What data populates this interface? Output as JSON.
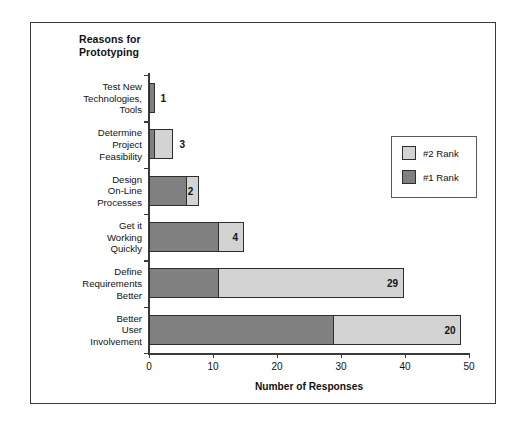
{
  "chart_data": {
    "type": "bar",
    "orientation": "horizontal",
    "stacked": true,
    "title": "Reasons for\nPrototyping",
    "xlabel": "Number of Responses",
    "ylabel": "",
    "xlim": [
      0,
      50
    ],
    "xticks": [
      0,
      10,
      20,
      30,
      40,
      50
    ],
    "xtick_labels": [
      "0",
      "10",
      "20",
      "30",
      "40",
      "50"
    ],
    "grid": false,
    "legend_position": "upper right",
    "categories": [
      "Test New\nTechnologies,\nTools",
      "Determine\nProject\nFeasibility",
      "Design\nOn-Line\nProcesses",
      "Get it\nWorking\nQuickly",
      "Define\nRequirements\nBetter",
      "Better\nUser\nInvolvement"
    ],
    "series": [
      {
        "name": "#1 Rank",
        "color": "#808080",
        "values": [
          1,
          1,
          6,
          11,
          11,
          29
        ]
      },
      {
        "name": "#2 Rank",
        "color": "#d3d3d3",
        "values": [
          0,
          3,
          2,
          4,
          29,
          20
        ]
      }
    ],
    "data_labels": [
      "1",
      "3",
      "2",
      "4",
      "29",
      "20"
    ],
    "totals": [
      1,
      4,
      8,
      15,
      40,
      49
    ]
  },
  "legend": {
    "items": [
      {
        "label": "#2 Rank",
        "color": "#d3d3d3"
      },
      {
        "label": "#1 Rank",
        "color": "#808080"
      }
    ]
  }
}
